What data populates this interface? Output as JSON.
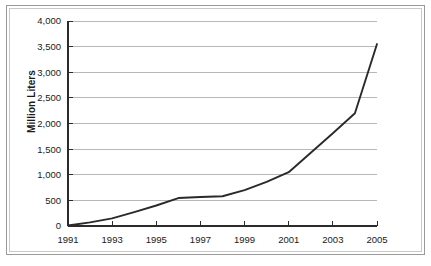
{
  "figure": {
    "border_color": "#9a9a9a",
    "inner_border_color": "#c9c9c9",
    "background": "#ffffff"
  },
  "chart_data": {
    "type": "line",
    "title": "",
    "subtitle": "",
    "xlabel": "",
    "ylabel": "Million Liters",
    "x": [
      1991,
      1992,
      1993,
      1994,
      1995,
      1996,
      1997,
      1998,
      1999,
      2000,
      2001,
      2002,
      2003,
      2004,
      2005
    ],
    "values": [
      10,
      70,
      150,
      270,
      400,
      545,
      565,
      580,
      700,
      860,
      1050,
      1430,
      1810,
      2200,
      3550
    ],
    "series": [
      {
        "name": "Million Liters",
        "color": "#2a2a2a",
        "values": [
          10,
          70,
          150,
          270,
          400,
          545,
          565,
          580,
          700,
          860,
          1050,
          1430,
          1810,
          2200,
          3550
        ]
      }
    ],
    "xlim": [
      1991,
      2005
    ],
    "ylim": [
      0,
      4000
    ],
    "ytick_values": [
      0,
      500,
      1000,
      1500,
      2000,
      2500,
      3000,
      3500,
      4000
    ],
    "ytick_labels": [
      "0",
      "500",
      "1,000",
      "1,500",
      "2,000",
      "2,500",
      "3,000",
      "3,500",
      "4,000"
    ],
    "xtick_values": [
      1991,
      1993,
      1995,
      1997,
      1999,
      2001,
      2003,
      2005
    ],
    "xtick_labels": [
      "1991",
      "1993",
      "1995",
      "1997",
      "1999",
      "2001",
      "2003",
      "2005"
    ],
    "grid": true,
    "grid_axis": "y",
    "grid_color": "#a6a6a6",
    "legend": false,
    "legend_position": "none",
    "annotations": []
  }
}
